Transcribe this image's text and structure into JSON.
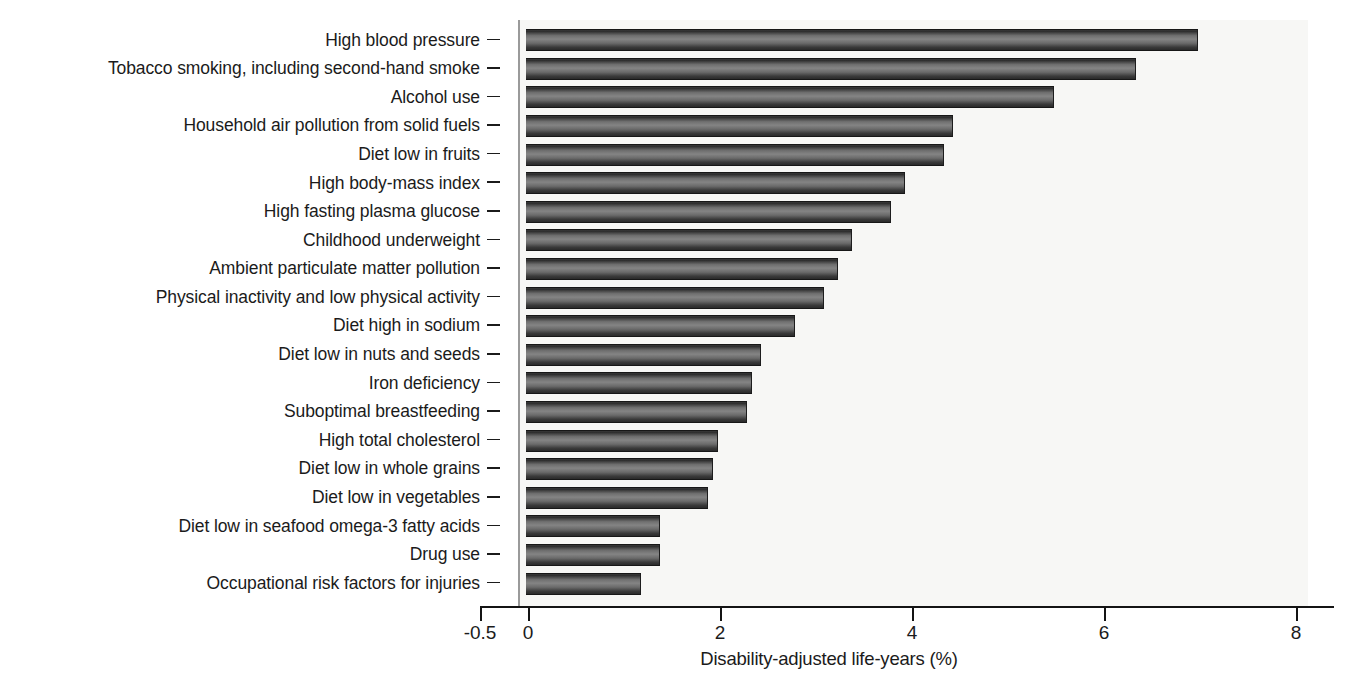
{
  "chart_data": {
    "type": "bar",
    "orientation": "horizontal",
    "title": "",
    "subtitle": "",
    "xlabel": "Disability-adjusted life-years (%)",
    "ylabel": "",
    "xlim": [
      -0.5,
      8.4
    ],
    "xticks": [
      -0.5,
      0,
      2,
      4,
      6,
      8
    ],
    "xtick_labels": [
      "-0.5",
      "0",
      "2",
      "4",
      "6",
      "8"
    ],
    "grid": false,
    "legend": false,
    "bar_color": "#5a5a5a",
    "bar_edge_color": "#171717",
    "plot_background": "#f7f7f5",
    "categories": [
      "High blood pressure",
      "Tobacco smoking, including second-hand smoke",
      "Alcohol use",
      "Household air pollution from solid fuels",
      "Diet low in fruits",
      "High body-mass index",
      "High fasting plasma glucose",
      "Childhood underweight",
      "Ambient particulate matter pollution",
      "Physical inactivity and low physical activity",
      "Diet high in sodium",
      "Diet low in nuts and seeds",
      "Iron deficiency",
      "Suboptimal breastfeeding",
      "High total cholesterol",
      "Diet low in whole grains",
      "Diet low in vegetables",
      "Diet low in seafood omega-3 fatty acids",
      "Drug use",
      "Occupational risk factors for injuries"
    ],
    "values": [
      7.0,
      6.35,
      5.5,
      4.45,
      4.35,
      3.95,
      3.8,
      3.4,
      3.25,
      3.1,
      2.8,
      2.45,
      2.35,
      2.3,
      2.0,
      1.95,
      1.9,
      1.4,
      1.4,
      1.2
    ]
  }
}
